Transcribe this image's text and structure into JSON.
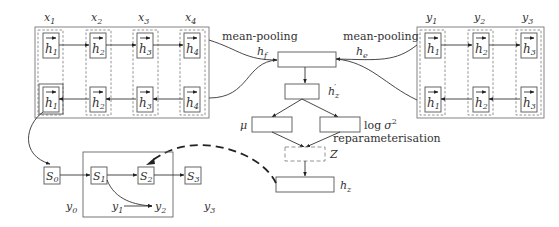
{
  "encoder_source": {
    "column_labels": [
      "x",
      "x",
      "x",
      "x"
    ],
    "column_subs": [
      "1",
      "2",
      "3",
      "4"
    ],
    "forward_cells": [
      {
        "h": "h",
        "sub": "1"
      },
      {
        "h": "h",
        "sub": "2"
      },
      {
        "h": "h",
        "sub": "3"
      },
      {
        "h": "h",
        "sub": "4"
      }
    ],
    "backward_cells": [
      {
        "h": "h",
        "sub": "1"
      },
      {
        "h": "h",
        "sub": "2"
      },
      {
        "h": "h",
        "sub": "3"
      },
      {
        "h": "h",
        "sub": "4"
      }
    ],
    "pooling_label": "mean-pooling",
    "output_label": "h",
    "output_sub": "f"
  },
  "encoder_target": {
    "column_labels": [
      "y",
      "y",
      "y"
    ],
    "column_subs": [
      "1",
      "2",
      "3"
    ],
    "forward_cells": [
      {
        "h": "h",
        "sub": "1"
      },
      {
        "h": "h",
        "sub": "2"
      },
      {
        "h": "h",
        "sub": "3"
      }
    ],
    "backward_cells": [
      {
        "h": "h",
        "sub": "1"
      },
      {
        "h": "h",
        "sub": "2"
      },
      {
        "h": "h",
        "sub": "3"
      }
    ],
    "pooling_label": "mean-pooling",
    "output_label": "h",
    "output_sub": "e"
  },
  "latent": {
    "hz_prime_label": "h",
    "hz_prime_sub": "z",
    "hz_prime_mark": "′",
    "mu_label": "μ",
    "logvar_log": "log",
    "logvar_sigma": "σ",
    "logvar_sup": "2",
    "reparam_label": "reparameterisation",
    "z_label": "Z",
    "hz_label": "h",
    "hz_sub": "z"
  },
  "decoder": {
    "states": [
      {
        "label": "S",
        "sub": "0"
      },
      {
        "label": "S",
        "sub": "1"
      },
      {
        "label": "S",
        "sub": "2"
      },
      {
        "label": "S",
        "sub": "3"
      }
    ],
    "outputs": [
      {
        "label": "y",
        "sub": "0"
      },
      {
        "label": "y",
        "sub": "1"
      },
      {
        "label": "y",
        "sub": "2"
      },
      {
        "label": "y",
        "sub": "3"
      }
    ]
  },
  "colors": {
    "stroke": "#555555",
    "outer_stroke": "#777777",
    "text": "#333333",
    "background": "#ffffff"
  }
}
